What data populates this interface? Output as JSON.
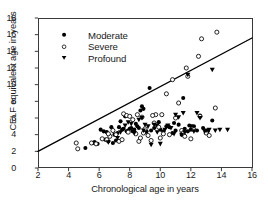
{
  "chart_data": {
    "type": "scatter",
    "title": "",
    "xlabel": "Chronological age in years",
    "ylabel": "CELF equivalent age in years",
    "xlim": [
      2,
      16
    ],
    "ylim": [
      0,
      18
    ],
    "xticks": [
      2,
      4,
      6,
      8,
      10,
      12,
      14,
      16
    ],
    "yticks": [
      0,
      2,
      4,
      6,
      8,
      10,
      12,
      14,
      16,
      18
    ],
    "grid": false,
    "legend_position": "upper-left-inside",
    "reference_line": {
      "label": "",
      "x": [
        2,
        16
      ],
      "y": [
        2.0,
        15.6
      ],
      "color": "#000000"
    },
    "series": [
      {
        "name": "Moderate",
        "marker": "filled-circle",
        "color": "#000000",
        "points": [
          [
            5.1,
            2.4
          ],
          [
            5.6,
            3.0
          ],
          [
            5.7,
            3.1
          ],
          [
            5.9,
            2.9
          ],
          [
            6.1,
            4.6
          ],
          [
            6.3,
            4.4
          ],
          [
            6.4,
            3.4
          ],
          [
            6.5,
            4.3
          ],
          [
            6.6,
            3.2
          ],
          [
            6.8,
            4.9
          ],
          [
            7.0,
            4.0
          ],
          [
            7.2,
            4.2
          ],
          [
            7.3,
            4.9
          ],
          [
            7.4,
            5.6
          ],
          [
            7.5,
            4.6
          ],
          [
            7.6,
            4.7
          ],
          [
            7.7,
            6.2
          ],
          [
            7.8,
            4.4
          ],
          [
            7.9,
            4.5
          ],
          [
            8.0,
            4.7
          ],
          [
            8.1,
            4.8
          ],
          [
            8.2,
            4.4
          ],
          [
            8.3,
            4.6
          ],
          [
            8.5,
            5.0
          ],
          [
            8.6,
            4.8
          ],
          [
            8.7,
            6.9
          ],
          [
            8.8,
            7.4
          ],
          [
            8.9,
            7.1
          ],
          [
            9.0,
            4.3
          ],
          [
            9.1,
            4.4
          ],
          [
            9.3,
            9.6
          ],
          [
            9.4,
            4.5
          ],
          [
            9.6,
            4.8
          ],
          [
            9.8,
            5.1
          ],
          [
            10.0,
            4.6
          ],
          [
            10.2,
            4.4
          ],
          [
            10.4,
            5.0
          ],
          [
            10.6,
            4.9
          ],
          [
            10.8,
            4.2
          ],
          [
            11.0,
            4.5
          ],
          [
            11.2,
            5.2
          ],
          [
            11.4,
            4.0
          ],
          [
            11.5,
            8.4
          ],
          [
            11.6,
            4.7
          ],
          [
            11.8,
            4.4
          ],
          [
            12.0,
            4.6
          ],
          [
            12.2,
            5.0
          ],
          [
            12.4,
            4.5
          ],
          [
            12.6,
            6.3
          ],
          [
            12.8,
            4.8
          ],
          [
            13.1,
            4.4
          ],
          [
            13.4,
            5.7
          ],
          [
            6.9,
            3.0
          ],
          [
            7.1,
            3.3
          ],
          [
            8.4,
            5.3
          ],
          [
            9.9,
            5.5
          ],
          [
            10.9,
            5.4
          ],
          [
            11.9,
            5.1
          ]
        ]
      },
      {
        "name": "Severe",
        "marker": "open-circle",
        "color": "#000000",
        "points": [
          [
            4.5,
            3.0
          ],
          [
            4.6,
            2.3
          ],
          [
            5.5,
            3.0
          ],
          [
            5.8,
            2.9
          ],
          [
            6.2,
            3.5
          ],
          [
            6.5,
            3.4
          ],
          [
            6.7,
            3.8
          ],
          [
            6.9,
            4.5
          ],
          [
            7.1,
            4.0
          ],
          [
            7.3,
            3.2
          ],
          [
            7.5,
            3.4
          ],
          [
            7.6,
            6.5
          ],
          [
            7.8,
            6.3
          ],
          [
            8.0,
            6.2
          ],
          [
            8.2,
            5.8
          ],
          [
            8.4,
            4.1
          ],
          [
            8.5,
            6.4
          ],
          [
            8.6,
            3.2
          ],
          [
            8.8,
            6.1
          ],
          [
            8.9,
            4.2
          ],
          [
            9.0,
            4.7
          ],
          [
            9.2,
            3.9
          ],
          [
            9.4,
            3.3
          ],
          [
            9.6,
            5.4
          ],
          [
            9.7,
            6.4
          ],
          [
            9.9,
            4.9
          ],
          [
            10.0,
            3.6
          ],
          [
            10.2,
            4.1
          ],
          [
            10.4,
            8.9
          ],
          [
            10.6,
            4.0
          ],
          [
            10.8,
            10.6
          ],
          [
            11.0,
            6.0
          ],
          [
            11.2,
            7.8
          ],
          [
            11.4,
            4.5
          ],
          [
            11.5,
            4.2
          ],
          [
            11.6,
            3.8
          ],
          [
            11.7,
            12.0
          ],
          [
            11.8,
            11.0
          ],
          [
            12.0,
            3.5
          ],
          [
            12.2,
            4.6
          ],
          [
            12.5,
            13.4
          ],
          [
            12.6,
            6.2
          ],
          [
            12.7,
            15.5
          ],
          [
            13.0,
            4.2
          ],
          [
            13.2,
            3.9
          ],
          [
            13.6,
            7.2
          ],
          [
            13.7,
            16.3
          ],
          [
            7.9,
            4.3
          ],
          [
            8.7,
            3.6
          ],
          [
            9.5,
            6.3
          ],
          [
            10.1,
            6.4
          ],
          [
            6.6,
            4.1
          ]
        ]
      },
      {
        "name": "Profound",
        "marker": "filled-triangle-down",
        "color": "#000000",
        "points": [
          [
            6.6,
            3.1
          ],
          [
            7.2,
            3.6
          ],
          [
            7.4,
            4.3
          ],
          [
            7.7,
            5.1
          ],
          [
            7.9,
            5.5
          ],
          [
            8.1,
            5.3
          ],
          [
            8.3,
            4.2
          ],
          [
            8.6,
            5.8
          ],
          [
            8.8,
            6.0
          ],
          [
            9.0,
            5.2
          ],
          [
            9.2,
            5.0
          ],
          [
            9.4,
            2.8
          ],
          [
            9.6,
            5.2
          ],
          [
            9.8,
            4.3
          ],
          [
            10.0,
            2.9
          ],
          [
            10.3,
            4.6
          ],
          [
            10.5,
            5.1
          ],
          [
            10.7,
            4.8
          ],
          [
            11.0,
            6.4
          ],
          [
            11.2,
            6.1
          ],
          [
            11.4,
            4.0
          ],
          [
            11.5,
            6.6
          ],
          [
            11.6,
            4.3
          ],
          [
            11.8,
            11.2
          ],
          [
            12.0,
            5.0
          ],
          [
            12.2,
            4.4
          ],
          [
            12.4,
            6.6
          ],
          [
            12.6,
            6.0
          ],
          [
            13.0,
            4.5
          ],
          [
            13.2,
            4.6
          ],
          [
            13.4,
            11.8
          ],
          [
            13.6,
            4.5
          ],
          [
            13.9,
            4.6
          ],
          [
            14.4,
            4.6
          ],
          [
            12.9,
            4.4
          ],
          [
            8.9,
            4.5
          ],
          [
            10.9,
            4.1
          ]
        ]
      }
    ]
  },
  "legend": {
    "items": [
      {
        "label": "Moderate",
        "marker": "filled-circle"
      },
      {
        "label": "Severe",
        "marker": "open-circle"
      },
      {
        "label": "Profound",
        "marker": "filled-triangle-down"
      }
    ]
  }
}
